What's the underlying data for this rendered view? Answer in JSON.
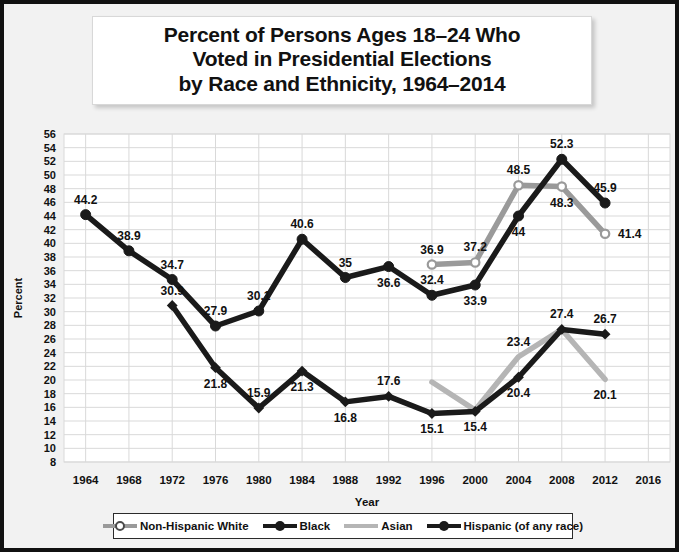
{
  "title": {
    "line1": "Percent of Persons Ages 18–24 Who",
    "line2": "Voted in Presidential Elections",
    "line3": "by Race and Ethnicity, 1964–2014"
  },
  "colors": {
    "non_hispanic_white": "#9a9a9a",
    "black": "#1a1a1a",
    "asian": "#b5b5b5",
    "hispanic": "#1a1a1a",
    "frame": "#111111",
    "grid": "#d9d9d9",
    "plot_background": "#ffffff",
    "page_background": "#f2f2f2"
  },
  "chart_data": {
    "type": "line",
    "title": "Percent of Persons Ages 18–24 Who Voted in Presidential Elections by Race and Ethnicity, 1964–2014",
    "xlabel": "Year",
    "ylabel": "Percent",
    "x": [
      1964,
      1968,
      1972,
      1976,
      1980,
      1984,
      1988,
      1992,
      1996,
      2000,
      2004,
      2008,
      2012,
      2016
    ],
    "xticks": [
      "1964",
      "1968",
      "1972",
      "1976",
      "1980",
      "1984",
      "1988",
      "1992",
      "1996",
      "2000",
      "2004",
      "2008",
      "2012",
      "2016"
    ],
    "yticks": [
      8,
      10,
      12,
      14,
      16,
      18,
      20,
      22,
      24,
      26,
      28,
      30,
      32,
      34,
      36,
      38,
      40,
      42,
      44,
      46,
      48,
      50,
      52,
      54,
      56
    ],
    "ylim": [
      8,
      56
    ],
    "xlim": [
      1962,
      2018
    ],
    "grid": true,
    "legend_position": "bottom",
    "series": [
      {
        "name": "Non-Hispanic White",
        "color": "#9a9a9a",
        "marker": "open-circle",
        "points": [
          {
            "x": 1996,
            "y": 36.9,
            "label": "36.9",
            "label_pos": "above"
          },
          {
            "x": 2000,
            "y": 37.2,
            "label": "37.2",
            "label_pos": "above"
          },
          {
            "x": 2004,
            "y": 48.5,
            "label": "48.5",
            "label_pos": "above"
          },
          {
            "x": 2008,
            "y": 48.3,
            "label": "48.3",
            "label_pos": "below"
          },
          {
            "x": 2012,
            "y": 41.4,
            "label": "41.4",
            "label_pos": "right"
          }
        ]
      },
      {
        "name": "Black",
        "color": "#1a1a1a",
        "marker": "solid-circle",
        "points": [
          {
            "x": 1964,
            "y": 44.2,
            "label": "44.2",
            "label_pos": "above"
          },
          {
            "x": 1968,
            "y": 38.9,
            "label": "38.9",
            "label_pos": "above"
          },
          {
            "x": 1972,
            "y": 34.7,
            "label": "34.7",
            "label_pos": "above"
          },
          {
            "x": 1976,
            "y": 27.9,
            "label": "27.9",
            "label_pos": "above"
          },
          {
            "x": 1980,
            "y": 30.1,
            "label": "30.1",
            "label_pos": "above"
          },
          {
            "x": 1984,
            "y": 40.6,
            "label": "40.6",
            "label_pos": "above"
          },
          {
            "x": 1988,
            "y": 35.0,
            "label": "35",
            "label_pos": "above"
          },
          {
            "x": 1992,
            "y": 36.6,
            "label": "36.6",
            "label_pos": "below"
          },
          {
            "x": 1996,
            "y": 32.4,
            "label": "32.4",
            "label_pos": "above"
          },
          {
            "x": 2000,
            "y": 33.9,
            "label": "33.9",
            "label_pos": "below"
          },
          {
            "x": 2004,
            "y": 44.0,
            "label": "44",
            "label_pos": "below"
          },
          {
            "x": 2008,
            "y": 52.3,
            "label": "52.3",
            "label_pos": "above"
          },
          {
            "x": 2012,
            "y": 45.9,
            "label": "45.9",
            "label_pos": "above"
          }
        ]
      },
      {
        "name": "Asian",
        "color": "#b5b5b5",
        "marker": "none",
        "points": [
          {
            "x": 1996,
            "y": 19.7,
            "label": "",
            "label_pos": "above"
          },
          {
            "x": 2000,
            "y": 15.6,
            "label": "",
            "label_pos": "below"
          },
          {
            "x": 2004,
            "y": 23.4,
            "label": "23.4",
            "label_pos": "above"
          },
          {
            "x": 2008,
            "y": 27.4,
            "label": "",
            "label_pos": "above"
          },
          {
            "x": 2012,
            "y": 20.1,
            "label": "20.1",
            "label_pos": "below"
          }
        ]
      },
      {
        "name": "Hispanic (of any race)",
        "color": "#1a1a1a",
        "marker": "solid-diamond",
        "points": [
          {
            "x": 1972,
            "y": 30.9,
            "label": "30.9",
            "label_pos": "above"
          },
          {
            "x": 1976,
            "y": 21.8,
            "label": "21.8",
            "label_pos": "below"
          },
          {
            "x": 1980,
            "y": 15.9,
            "label": "15.9",
            "label_pos": "above"
          },
          {
            "x": 1984,
            "y": 21.3,
            "label": "21.3",
            "label_pos": "below"
          },
          {
            "x": 1988,
            "y": 16.8,
            "label": "16.8",
            "label_pos": "below"
          },
          {
            "x": 1992,
            "y": 17.6,
            "label": "17.6",
            "label_pos": "above"
          },
          {
            "x": 1996,
            "y": 15.1,
            "label": "15.1",
            "label_pos": "below"
          },
          {
            "x": 2000,
            "y": 15.4,
            "label": "15.4",
            "label_pos": "below"
          },
          {
            "x": 2004,
            "y": 20.4,
            "label": "20.4",
            "label_pos": "below"
          },
          {
            "x": 2008,
            "y": 27.4,
            "label": "27.4",
            "label_pos": "above"
          },
          {
            "x": 2012,
            "y": 26.7,
            "label": "26.7",
            "label_pos": "above"
          }
        ]
      }
    ]
  },
  "legend": {
    "items": [
      {
        "label": "Non-Hispanic White",
        "color": "#9a9a9a",
        "marker": "open-circle"
      },
      {
        "label": "Black",
        "color": "#1a1a1a",
        "marker": "solid-circle"
      },
      {
        "label": "Asian",
        "color": "#b5b5b5",
        "marker": "none"
      },
      {
        "label": "Hispanic (of any race)",
        "color": "#1a1a1a",
        "marker": "solid-circle"
      }
    ]
  }
}
